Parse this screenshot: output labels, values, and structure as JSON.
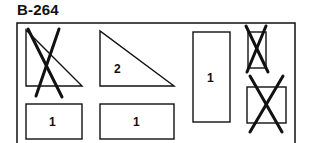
{
  "figure": {
    "title": "B-264",
    "colors": {
      "stroke": "#111111",
      "background": "#ffffff"
    },
    "shapes": [
      {
        "id": "triangle-crossed",
        "type": "right-triangle",
        "crossed": true,
        "label": ""
      },
      {
        "id": "triangle-2",
        "type": "right-triangle",
        "crossed": false,
        "label": "2"
      },
      {
        "id": "tall-rect",
        "type": "rectangle",
        "crossed": false,
        "label": "1"
      },
      {
        "id": "small-rect-crossed",
        "type": "rectangle",
        "crossed": true,
        "label": ""
      },
      {
        "id": "square-crossed",
        "type": "rectangle",
        "crossed": true,
        "label": ""
      },
      {
        "id": "bottom-rect-left",
        "type": "rectangle",
        "crossed": false,
        "label": "1"
      },
      {
        "id": "bottom-rect-mid",
        "type": "rectangle",
        "crossed": false,
        "label": "1"
      }
    ]
  }
}
